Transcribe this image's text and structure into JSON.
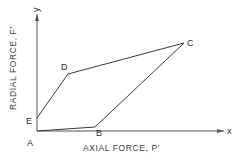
{
  "diagram": {
    "title": "",
    "x_axis": {
      "label": "AXIAL FORCE, P′",
      "end_label": "x"
    },
    "y_axis": {
      "label": "RADIAL FORCE, F′",
      "end_label": "y"
    },
    "points": [
      {
        "name": "A",
        "x": 37,
        "y": 131
      },
      {
        "name": "B",
        "x": 95,
        "y": 127
      },
      {
        "name": "C",
        "x": 184,
        "y": 43
      },
      {
        "name": "D",
        "x": 68,
        "y": 74
      },
      {
        "name": "E",
        "x": 37,
        "y": 118
      }
    ],
    "polygon_order": [
      "A",
      "B",
      "C",
      "D",
      "E"
    ],
    "colors": {
      "line": "#3a3a3a",
      "text": "#2a2a2a",
      "background": "#ffffff"
    }
  }
}
